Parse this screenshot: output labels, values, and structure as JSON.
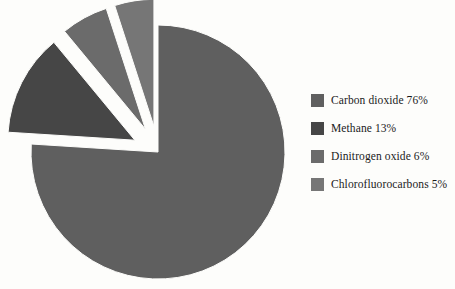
{
  "chart_data": {
    "type": "pie",
    "title": "",
    "subtitle": "",
    "xlabel": "",
    "ylabel": "",
    "legend_position": "right",
    "grid": false,
    "units": "percent",
    "start_angle_deg": 0,
    "direction": "clockwise",
    "categories": [
      "Carbon dioxide",
      "Methane",
      "Dinitrogen oxide",
      "Chlorofluorocarbons"
    ],
    "values": [
      76,
      13,
      6,
      5
    ],
    "value_labels": [
      "76%",
      "13%",
      "6%",
      "5%"
    ],
    "legend_entries": [
      "Carbon dioxide 76%",
      "Methane 13%",
      "Dinitrogen oxide 6%",
      "Chlorofluorocarbons 5%"
    ],
    "slice_colors": [
      "#5f5f5f",
      "#464646",
      "#6b6b6b",
      "#767676"
    ],
    "exploded": [
      false,
      true,
      true,
      true
    ],
    "slices": [
      {
        "label": "Carbon dioxide",
        "value": 76,
        "value_label": "76%",
        "color": "#5f5f5f",
        "exploded": false
      },
      {
        "label": "Methane",
        "value": 13,
        "value_label": "13%",
        "color": "#464646",
        "exploded": true
      },
      {
        "label": "Dinitrogen oxide",
        "value": 6,
        "value_label": "6%",
        "color": "#6b6b6b",
        "exploded": true
      },
      {
        "label": "Chlorofluorocarbons",
        "value": 5,
        "value_label": "5%",
        "color": "#767676",
        "exploded": true
      }
    ]
  },
  "legend": {
    "items": [
      {
        "label": "Carbon dioxide 76%",
        "color": "#5f5f5f"
      },
      {
        "label": "Methane 13%",
        "color": "#464646"
      },
      {
        "label": "Dinitrogen oxide 6%",
        "color": "#6b6b6b"
      },
      {
        "label": "Chlorofluorocarbons 5%",
        "color": "#767676"
      }
    ]
  },
  "style": {
    "background": "#fdfdfb",
    "text_color": "#1b1b1b"
  }
}
